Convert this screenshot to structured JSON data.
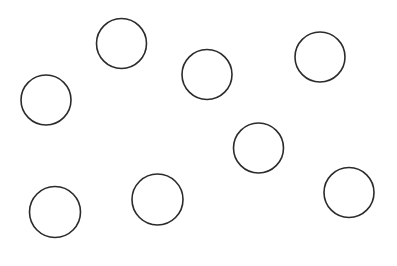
{
  "canvas": {
    "width": 397,
    "height": 266,
    "background": "#ffffff"
  },
  "style": {
    "stroke": "#2b2b2b",
    "stroke_width": 1.6,
    "fill": "none"
  },
  "circles": [
    {
      "cx": 121.5,
      "cy": 43.5,
      "r": 25
    },
    {
      "cx": 46,
      "cy": 100,
      "r": 25
    },
    {
      "cx": 207,
      "cy": 74.5,
      "r": 25
    },
    {
      "cx": 320,
      "cy": 57,
      "r": 25
    },
    {
      "cx": 258.5,
      "cy": 148,
      "r": 25
    },
    {
      "cx": 349,
      "cy": 192.5,
      "r": 25
    },
    {
      "cx": 55,
      "cy": 212,
      "r": 25.5
    },
    {
      "cx": 157.5,
      "cy": 199.5,
      "r": 25.5
    }
  ]
}
